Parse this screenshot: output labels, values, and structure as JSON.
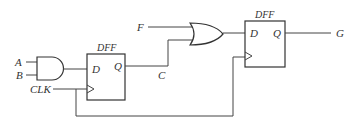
{
  "diagram": {
    "type": "digital logic circuit",
    "inputs": {
      "a": "A",
      "b": "B",
      "clk": "CLK",
      "f": "F"
    },
    "outputs": {
      "g": "G"
    },
    "signals": {
      "c": "C"
    },
    "gates": [
      {
        "id": "and1",
        "type": "AND",
        "inputs": [
          "A",
          "B"
        ],
        "output": "D of DFF1"
      },
      {
        "id": "or1",
        "type": "OR",
        "inputs": [
          "F",
          "C"
        ],
        "output": "D of DFF2"
      }
    ],
    "flipflops": [
      {
        "id": "dff1",
        "label": "DFF",
        "d": "D",
        "q": "Q",
        "clock": "CLK",
        "q_signal": "C"
      },
      {
        "id": "dff2",
        "label": "DFF",
        "d": "D",
        "q": "Q",
        "clock": "CLK",
        "q_signal": "G"
      }
    ]
  }
}
